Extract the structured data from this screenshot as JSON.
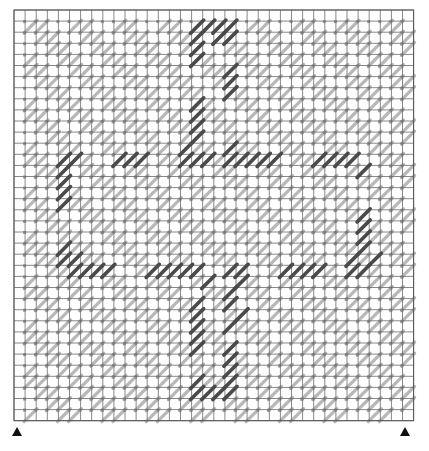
{
  "grid": {
    "cols": 36,
    "rows": 37,
    "origin_x": 14,
    "origin_y": 10,
    "cell": 11.1,
    "line_color": "#6a6a6a",
    "border_color": "#555555"
  },
  "colors": {
    "light_stitch": "#b8b8b8",
    "dark_stitch": "#4a4a4a",
    "tick": "#9a9a9a"
  },
  "light_pattern": {
    "description": "diagonal bands of light gray half-cross stitches",
    "period": 4,
    "phases": [
      0,
      1
    ]
  },
  "dark_stitches": [
    [
      16,
      1
    ],
    [
      17,
      1
    ],
    [
      18,
      1
    ],
    [
      19,
      1
    ],
    [
      16,
      2
    ],
    [
      16,
      3
    ],
    [
      16,
      4
    ],
    [
      18,
      2
    ],
    [
      19,
      2
    ],
    [
      19,
      5
    ],
    [
      19,
      6
    ],
    [
      19,
      7
    ],
    [
      16,
      8
    ],
    [
      16,
      9
    ],
    [
      16,
      10
    ],
    [
      16,
      11
    ],
    [
      4,
      13
    ],
    [
      5,
      13
    ],
    [
      9,
      13
    ],
    [
      10,
      13
    ],
    [
      11,
      13
    ],
    [
      15,
      12
    ],
    [
      15,
      13
    ],
    [
      16,
      13
    ],
    [
      17,
      13
    ],
    [
      19,
      12
    ],
    [
      19,
      13
    ],
    [
      20,
      13
    ],
    [
      21,
      13
    ],
    [
      22,
      13
    ],
    [
      23,
      13
    ],
    [
      27,
      13
    ],
    [
      28,
      13
    ],
    [
      29,
      13
    ],
    [
      30,
      13
    ],
    [
      31,
      14
    ],
    [
      4,
      14
    ],
    [
      4,
      15
    ],
    [
      4,
      16
    ],
    [
      4,
      17
    ],
    [
      31,
      18
    ],
    [
      31,
      19
    ],
    [
      31,
      20
    ],
    [
      31,
      21
    ],
    [
      32,
      22
    ],
    [
      30,
      22
    ],
    [
      4,
      21
    ],
    [
      4,
      22
    ],
    [
      5,
      22
    ],
    [
      6,
      23
    ],
    [
      7,
      23
    ],
    [
      8,
      23
    ],
    [
      5,
      23
    ],
    [
      12,
      23
    ],
    [
      13,
      23
    ],
    [
      14,
      23
    ],
    [
      15,
      23
    ],
    [
      16,
      23
    ],
    [
      17,
      24
    ],
    [
      19,
      23
    ],
    [
      20,
      23
    ],
    [
      20,
      24
    ],
    [
      24,
      23
    ],
    [
      25,
      23
    ],
    [
      26,
      23
    ],
    [
      27,
      23
    ],
    [
      30,
      23
    ],
    [
      31,
      23
    ],
    [
      19,
      25
    ],
    [
      19,
      26
    ],
    [
      20,
      27
    ],
    [
      19,
      28
    ],
    [
      16,
      26
    ],
    [
      16,
      27
    ],
    [
      16,
      28
    ],
    [
      16,
      29
    ],
    [
      16,
      30
    ],
    [
      19,
      30
    ],
    [
      19,
      31
    ],
    [
      19,
      32
    ],
    [
      19,
      33
    ],
    [
      16,
      33
    ],
    [
      16,
      34
    ],
    [
      17,
      34
    ],
    [
      18,
      34
    ],
    [
      19,
      34
    ]
  ],
  "markers": [
    {
      "name": "left-marker",
      "x": 12,
      "y": 427
    },
    {
      "name": "right-marker",
      "x": 400,
      "y": 427
    }
  ]
}
